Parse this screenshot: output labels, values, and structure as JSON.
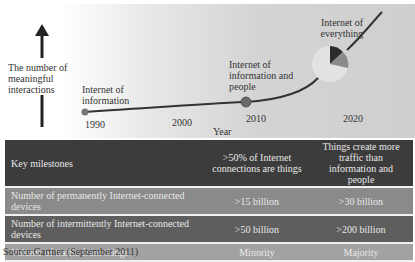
{
  "diagram": {
    "y_axis_label": "The number of meaningful interactions",
    "x_axis_label": "Year",
    "years": [
      "1990",
      "2000",
      "2010",
      "2020"
    ],
    "stages": [
      {
        "label": "Internet of information",
        "year": "1990"
      },
      {
        "label": "Internet of information and people",
        "year": "2010"
      },
      {
        "label": "Internet of everything",
        "year": "2020"
      }
    ]
  },
  "table": {
    "rows": [
      {
        "label": "Key milestones",
        "v2010": ">50% of Internet connections are things",
        "v2020": "Things create more traffic than information and people"
      },
      {
        "label": "Number of permanently Internet-connected devices",
        "v2010": ">15 billion",
        "v2020": ">30 billion"
      },
      {
        "label": "Number of intermittently Internet-connected devices",
        "v2010": ">50 billion",
        "v2020": ">200 billion"
      },
      {
        "label": "Volume of traffic from things",
        "v2010": "Minority",
        "v2020": "Majority"
      }
    ]
  },
  "source": "Source:Gartner (September 2011)",
  "colors": {
    "row_dark": "#3c3c3c",
    "row_mid": "#8a8a8a",
    "row_mid_dark": "#5e5e5e",
    "row_light": "#a2a2a2",
    "curve": "#333333"
  }
}
